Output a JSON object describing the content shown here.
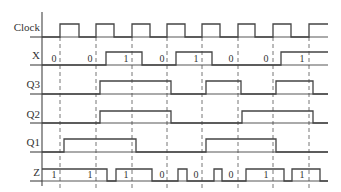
{
  "diagram": {
    "type": "timing-diagram",
    "clock_edges_x": [
      60,
      96,
      132,
      167,
      202,
      238,
      273,
      309
    ],
    "signals": [
      {
        "name": "Clock",
        "high_y": 24,
        "low_y": 37,
        "transitions": [
          [
            42,
            0
          ],
          [
            60,
            1
          ],
          [
            79,
            0
          ],
          [
            96,
            1
          ],
          [
            114,
            0
          ],
          [
            132,
            1
          ],
          [
            150,
            0
          ],
          [
            167,
            1
          ],
          [
            185,
            0
          ],
          [
            202,
            1
          ],
          [
            220,
            0
          ],
          [
            238,
            1
          ],
          [
            255,
            0
          ],
          [
            273,
            1
          ],
          [
            291,
            0
          ],
          [
            309,
            1
          ],
          [
            328,
            1
          ]
        ],
        "values": []
      },
      {
        "name": "X",
        "high_y": 52,
        "low_y": 65,
        "transitions": [
          [
            42,
            0
          ],
          [
            106,
            1
          ],
          [
            142,
            0
          ],
          [
            176,
            1
          ],
          [
            212,
            0
          ],
          [
            281,
            1
          ],
          [
            328,
            1
          ]
        ],
        "values": [
          {
            "x": 54,
            "text": "0"
          },
          {
            "x": 90,
            "text": "0"
          },
          {
            "x": 126,
            "text": "1"
          },
          {
            "x": 162,
            "text": "0"
          },
          {
            "x": 196,
            "text": "1"
          },
          {
            "x": 231,
            "text": "0"
          },
          {
            "x": 266,
            "text": "0"
          },
          {
            "x": 302,
            "text": "1"
          }
        ]
      },
      {
        "name": "Q3",
        "high_y": 81,
        "low_y": 94,
        "transitions": [
          [
            42,
            0
          ],
          [
            100,
            1
          ],
          [
            171,
            0
          ],
          [
            206,
            1
          ],
          [
            241,
            0
          ],
          [
            276,
            1
          ],
          [
            313,
            0
          ],
          [
            328,
            0
          ]
        ],
        "values": []
      },
      {
        "name": "Q2",
        "high_y": 111,
        "low_y": 123,
        "transitions": [
          [
            42,
            0
          ],
          [
            100,
            1
          ],
          [
            171,
            0
          ],
          [
            242,
            1
          ],
          [
            313,
            0
          ],
          [
            328,
            0
          ]
        ],
        "values": []
      },
      {
        "name": "Q1",
        "high_y": 139,
        "low_y": 152,
        "transitions": [
          [
            42,
            0
          ],
          [
            64,
            1
          ],
          [
            136,
            0
          ],
          [
            206,
            1
          ],
          [
            276,
            0
          ],
          [
            328,
            0
          ]
        ],
        "values": []
      },
      {
        "name": "Z",
        "high_y": 169,
        "low_y": 181,
        "transitions": [
          [
            42,
            1
          ],
          [
            107,
            0
          ],
          [
            116,
            1
          ],
          [
            152,
            0
          ],
          [
            178,
            1
          ],
          [
            187,
            0
          ],
          [
            214,
            1
          ],
          [
            222,
            0
          ],
          [
            246,
            1
          ],
          [
            284,
            0
          ],
          [
            292,
            1
          ],
          [
            320,
            0
          ],
          [
            328,
            0
          ]
        ],
        "values": [
          {
            "x": 54,
            "text": "1"
          },
          {
            "x": 90,
            "text": "1"
          },
          {
            "x": 126,
            "text": "1"
          },
          {
            "x": 162,
            "text": "0"
          },
          {
            "x": 196,
            "text": "0"
          },
          {
            "x": 231,
            "text": "0"
          },
          {
            "x": 266,
            "text": "1"
          },
          {
            "x": 302,
            "text": "1"
          }
        ]
      }
    ]
  }
}
